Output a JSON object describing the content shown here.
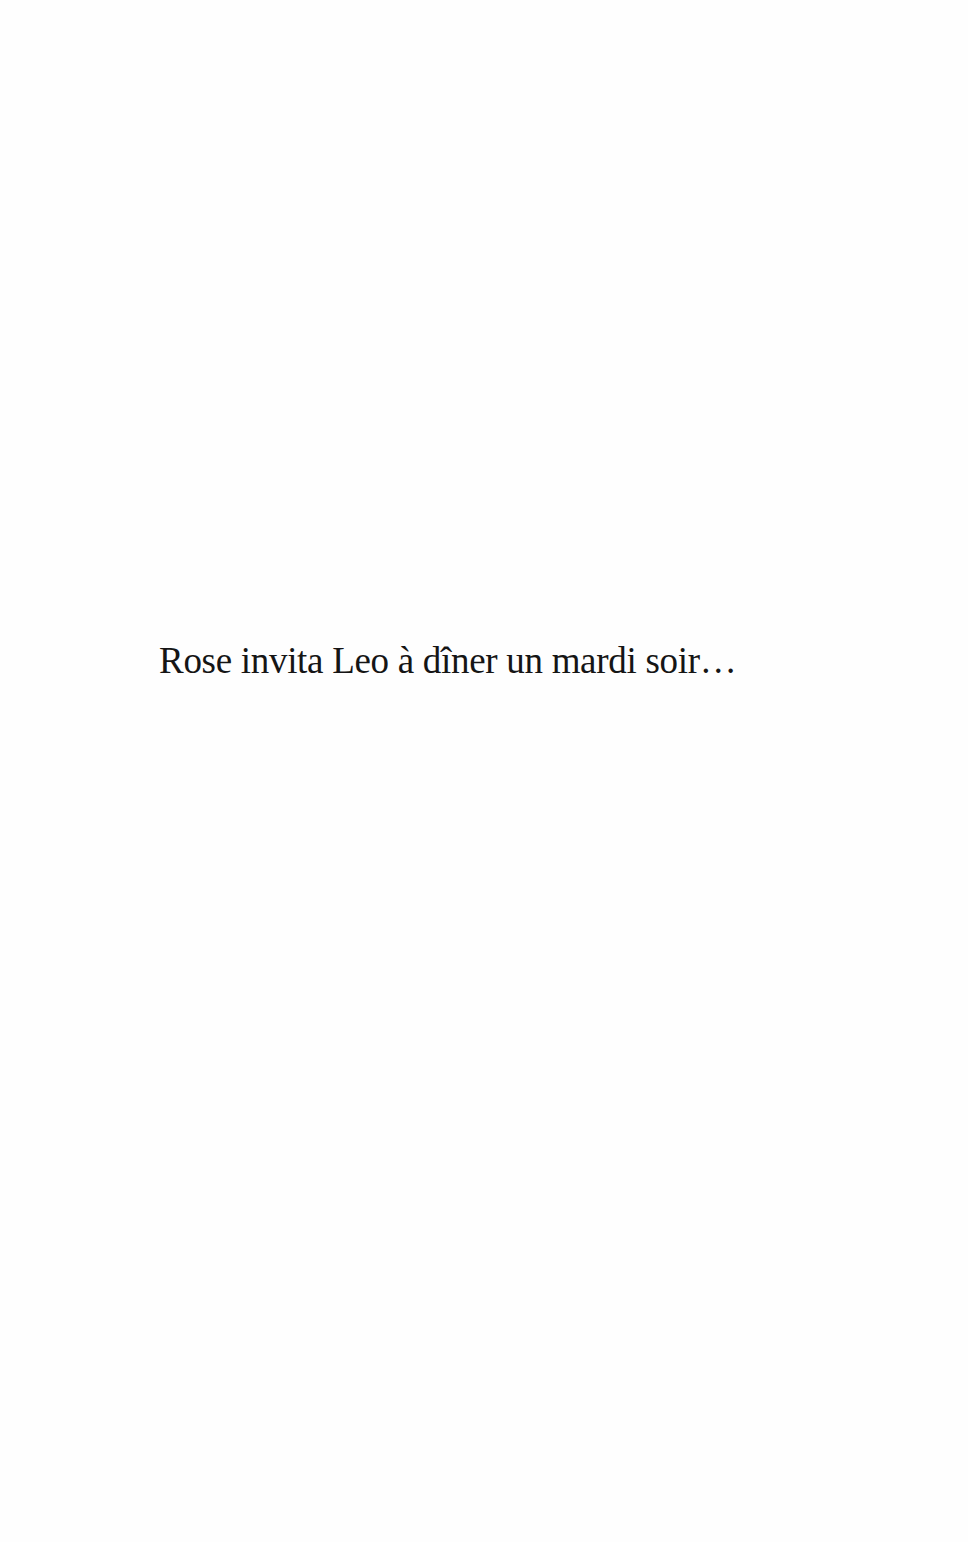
{
  "page": {
    "text": "Rose invita Leo à dîner un mardi soir…"
  }
}
